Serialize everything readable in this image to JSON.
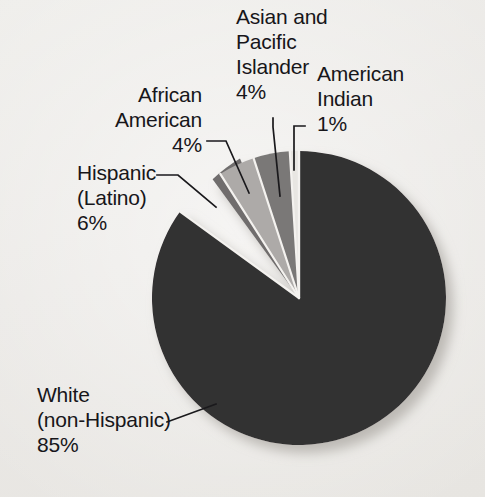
{
  "chart_data": {
    "type": "pie",
    "title": "",
    "subtitle": "",
    "xlabel": "",
    "ylabel": "",
    "legend_position": "callout-labels",
    "grid": false,
    "units": "percent",
    "total": 100,
    "categories": [
      "White (non-Hispanic)",
      "Hispanic (Latino)",
      "African American",
      "Asian and Pacific Islander",
      "American Indian"
    ],
    "values": [
      85,
      6,
      4,
      4,
      1
    ],
    "slices": [
      {
        "name": "white-non-hispanic",
        "label_line1": "White",
        "label_line2": "(non-Hispanic)",
        "label_value": "85%",
        "value": 85,
        "color": "#333033"
      },
      {
        "name": "hispanic-latino",
        "label_line1": "Hispanic",
        "label_line2": "(Latino)",
        "label_value": "6%",
        "value": 6,
        "color": "#6f6d6d"
      },
      {
        "name": "african-american",
        "label_line1": "African",
        "label_line2": "American",
        "label_value": "4%",
        "value": 4,
        "color": "#adaaa8"
      },
      {
        "name": "asian-pacific-islander",
        "label_line1": "Asian and",
        "label_line2": "Pacific",
        "label_line3": "Islander",
        "label_value": "4%",
        "value": 4,
        "color": "#7a7877"
      },
      {
        "name": "american-indian",
        "label_line1": "American",
        "label_line2": "Indian",
        "label_value": "1%",
        "value": 1,
        "color": "#e8e6e2"
      }
    ]
  },
  "labels": {
    "asian_pacific": "Asian and\nPacific\nIslander\n4%",
    "american_indian": "American\nIndian\n1%",
    "african_american": "African\nAmerican\n4%",
    "hispanic": "Hispanic\n(Latino)\n6%",
    "white": "White\n(non-Hispanic)\n85%"
  },
  "colors": {
    "background": "#eceae7",
    "text": "#17161a",
    "leader_line": "#1a191c",
    "slice_white_non_hispanic": "#333033",
    "slice_hispanic": "#6f6d6d",
    "slice_african_american": "#adaaa8",
    "slice_asian_pacific": "#7a7877",
    "slice_american_indian": "#e8e6e2",
    "slice_separator": "#f3f1ee",
    "shadow": "#c9c6c2"
  }
}
